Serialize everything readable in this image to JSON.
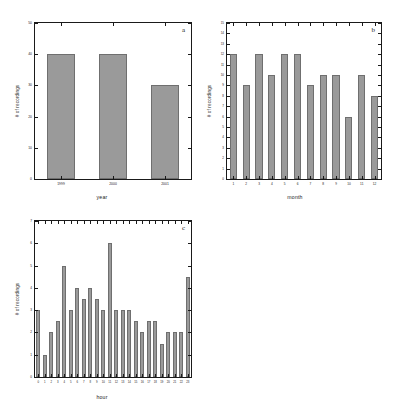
{
  "figure": {
    "background_color": "#ffffff",
    "bar_fill_color": "#9a9a9a",
    "bar_edge_color": "#6f6f6f",
    "axis_color": "#1a1a1a"
  },
  "panels": {
    "a": {
      "letter": "a",
      "ylabel": "# of recordings",
      "xlabel": "year"
    },
    "b": {
      "letter": "b",
      "ylabel": "# of recordings",
      "xlabel": "month"
    },
    "c": {
      "letter": "c",
      "ylabel": "# of recordings",
      "xlabel": "hour"
    }
  },
  "chart_data": [
    {
      "type": "bar",
      "panel": "a",
      "title": "",
      "xlabel": "year",
      "ylabel": "# of recordings",
      "categories": [
        "1999",
        "2000",
        "2001"
      ],
      "values": [
        40,
        40,
        30
      ],
      "ylim": [
        0,
        50
      ],
      "yticks": [
        0,
        10,
        20,
        30,
        40,
        50
      ],
      "ytick_labels": [
        "0",
        "10",
        "20",
        "30",
        "40",
        "50"
      ],
      "grid": false,
      "legend": false
    },
    {
      "type": "bar",
      "panel": "b",
      "title": "",
      "xlabel": "month",
      "ylabel": "# of recordings",
      "categories": [
        "1",
        "2",
        "3",
        "4",
        "5",
        "6",
        "7",
        "8",
        "9",
        "10",
        "11",
        "12"
      ],
      "values": [
        12,
        9,
        12,
        10,
        12,
        12,
        9,
        10,
        10,
        6,
        10,
        8
      ],
      "ylim": [
        0,
        15
      ],
      "yticks": [
        0,
        1,
        2,
        3,
        4,
        5,
        6,
        7,
        8,
        9,
        10,
        11,
        12,
        13,
        14,
        15
      ],
      "ytick_labels": [
        "0",
        "1",
        "2",
        "3",
        "4",
        "5",
        "6",
        "7",
        "8",
        "9",
        "10",
        "11",
        "12",
        "13",
        "14",
        "15"
      ],
      "grid": false,
      "legend": false
    },
    {
      "type": "bar",
      "panel": "c",
      "title": "",
      "xlabel": "hour",
      "ylabel": "# of recordings",
      "categories": [
        "0",
        "1",
        "2",
        "3",
        "4",
        "5",
        "6",
        "7",
        "8",
        "9",
        "10",
        "11",
        "12",
        "13",
        "14",
        "15",
        "16",
        "17",
        "18",
        "19",
        "20",
        "21",
        "22",
        "23"
      ],
      "values": [
        3,
        1,
        2,
        2.5,
        5,
        3,
        4,
        3.5,
        4,
        3.5,
        3,
        6,
        3,
        3,
        3,
        2.5,
        2,
        2.5,
        2.5,
        1.5,
        2,
        2,
        2,
        4.5
      ],
      "ylim": [
        0,
        7
      ],
      "yticks": [
        0,
        1,
        2,
        3,
        4,
        5,
        6,
        7
      ],
      "ytick_labels": [
        "0",
        "1",
        "2",
        "3",
        "4",
        "5",
        "6",
        "7"
      ],
      "grid": false,
      "legend": false
    }
  ]
}
